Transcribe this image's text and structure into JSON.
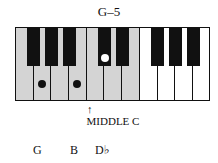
{
  "title": "G–5",
  "keyboard": {
    "white_keys": [
      "F",
      "G",
      "A",
      "B",
      "C",
      "D",
      "E",
      "F",
      "G",
      "A",
      "B"
    ],
    "black_keys": [
      "F#",
      "G#",
      "A#",
      "C#",
      "D#",
      "F#",
      "G#",
      "A#"
    ],
    "shaded_white_key_count": 7,
    "marked_notes": [
      {
        "key": "G",
        "type": "white",
        "dot_color": "#111111"
      },
      {
        "key": "B",
        "type": "white",
        "dot_color": "#111111"
      },
      {
        "key": "C#",
        "type": "black",
        "dot_color": "#ffffff"
      }
    ]
  },
  "middle_c_arrow": "↑",
  "middle_c_label": "MIDDLE C",
  "notes": [
    "G",
    "B",
    "D♭"
  ]
}
